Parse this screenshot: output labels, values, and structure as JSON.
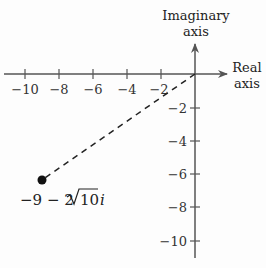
{
  "diagram": {
    "type": "complex-plane",
    "axes": {
      "horizontal": {
        "label_line1": "Real",
        "label_line2": "axis"
      },
      "vertical": {
        "label_line1": "Imaginary",
        "label_line2": "axis"
      }
    },
    "real_ticks": [
      "−10",
      "−8",
      "−6",
      "−4",
      "−2"
    ],
    "imag_ticks": [
      "−2",
      "−4",
      "−6",
      "−8",
      "−10"
    ],
    "point": {
      "label_main": "−9 − 2",
      "label_radicand": "10",
      "label_suffix": "i",
      "real": -9,
      "imag": -6.32
    },
    "colors": {
      "axis": "#555555",
      "ink": "#222222",
      "point": "#111111"
    }
  }
}
